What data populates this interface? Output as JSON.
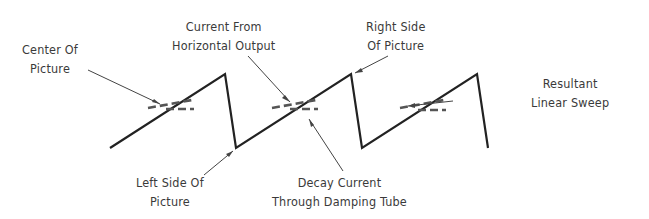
{
  "diagram": {
    "labels": {
      "center_of_picture": {
        "line1": "Center Of",
        "line2": "Picture"
      },
      "current_from_horizontal_output": {
        "line1": "Current From",
        "line2": "Horizontal Output"
      },
      "right_side_of_picture": {
        "line1": "Right Side",
        "line2": "Of Picture"
      },
      "resultant_linear_sweep": {
        "line1": "Resultant",
        "line2": "Linear Sweep"
      },
      "left_side_of_picture": {
        "line1": "Left Side Of",
        "line2": "Picture"
      },
      "decay_current": {
        "line1": "Decay Current",
        "line2": "Through Damping Tube"
      }
    },
    "colors": {
      "waveform": "#222222",
      "dashed": "#555555",
      "leader": "#444444",
      "text": "#3a3a3a"
    }
  }
}
